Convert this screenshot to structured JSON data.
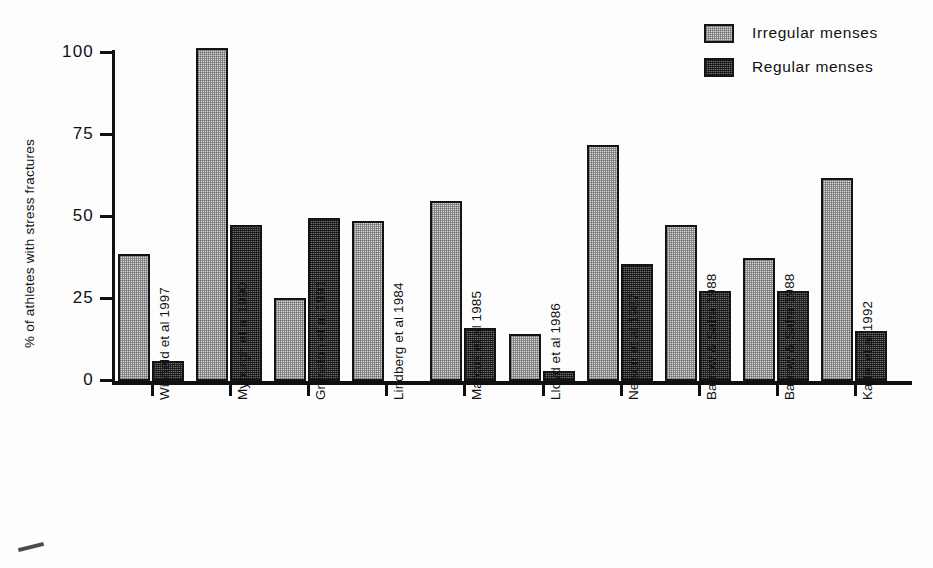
{
  "chart_data": {
    "type": "bar",
    "title": "",
    "xlabel": "",
    "ylabel": "% of athletes with stress fractures",
    "ylim": [
      0,
      100
    ],
    "yticks": [
      0,
      25,
      50,
      75,
      100
    ],
    "ytick_labels": [
      "0",
      "25",
      "50",
      "75",
      "100"
    ],
    "grid": false,
    "legend_position": "top-right",
    "categories": [
      "Winfield et al 1997",
      "Myburgh et al 1990",
      "Grimston et al 1991",
      "Lindberg et al 1984",
      "Marcus et al 1985",
      "Lloyd et al 1986",
      "Nelson et al 1987",
      "Barrow & Saha 1988",
      "Barrow & Saha 1988",
      "Kadel et al 1992"
    ],
    "series": [
      {
        "name": "Irregular menses",
        "color": "#d8d8d8",
        "values": [
          38,
          100,
          25,
          48,
          54,
          14,
          71,
          47,
          37,
          61
        ]
      },
      {
        "name": "Regular menses",
        "color": "#4a4a4a",
        "values": [
          6,
          47,
          49,
          null,
          16,
          3,
          35,
          27,
          27,
          15
        ]
      }
    ]
  },
  "legend": {
    "items": [
      {
        "label": "Irregular menses",
        "swatch": "light-swatch"
      },
      {
        "label": "Regular menses",
        "swatch": "dark-swatch"
      }
    ]
  },
  "axis": {
    "y_title": "% of athletes with stress fractures"
  }
}
